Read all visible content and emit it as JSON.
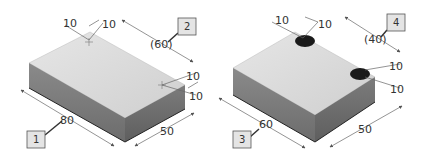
{
  "diagram": {
    "left_block": {
      "callouts": [
        {
          "id": "1",
          "label": "1"
        },
        {
          "id": "2",
          "label": "2"
        }
      ],
      "dimensions": {
        "top_a": "10",
        "top_b": "10",
        "ref": "(60)",
        "right_a": "10",
        "right_b": "10",
        "length": "80",
        "width": "50"
      }
    },
    "right_block": {
      "callouts": [
        {
          "id": "3",
          "label": "3"
        },
        {
          "id": "4",
          "label": "4"
        }
      ],
      "dimensions": {
        "top_a": "10",
        "top_b": "10",
        "ref": "(40)",
        "right_a": "10",
        "right_b": "10",
        "length": "60",
        "width": "50"
      }
    },
    "colors": {
      "top_face": "#d6d6d6",
      "front_face": "#7a7a7a",
      "side_face": "#6a6a6a",
      "hole": "#1a1a1a",
      "callout_fill": "#e4e4e4",
      "line": "#555555"
    }
  }
}
